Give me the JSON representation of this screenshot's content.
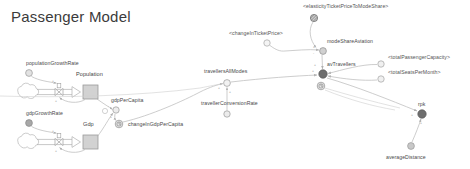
{
  "diagram": {
    "title": "Passenger Model",
    "type": "system-dynamics-stock-and-flow",
    "background_color": "#ffffff",
    "label_color": "#4a4a4a",
    "link_color": "#b8b8b8",
    "node_fill": "#d9d9d9",
    "node_stroke": "#9a9a9a",
    "highlight_fill": "#6e6e6e"
  },
  "stocks": [
    {
      "id": "population",
      "label": "Population",
      "x": 83,
      "y": 85,
      "w": 15,
      "h": 14,
      "label_x": 76,
      "label_y": 76
    },
    {
      "id": "gdp",
      "label": "Gdp",
      "x": 83,
      "y": 135,
      "w": 15,
      "h": 14,
      "label_x": 83,
      "label_y": 126
    }
  ],
  "flows": [
    {
      "id": "population-inflow",
      "source_cloud_x": 26,
      "source_cloud_y": 92,
      "valve_x": 59,
      "valve_y": 92,
      "target_x": 83,
      "target_y": 92
    },
    {
      "id": "gdp-inflow",
      "source_cloud_x": 26,
      "source_cloud_y": 142,
      "valve_x": 59,
      "valve_y": 142,
      "target_x": 83,
      "target_y": 142
    }
  ],
  "variables": [
    {
      "id": "populationGrowthRate",
      "label": "populationGrowthRate",
      "x": 29,
      "y": 73,
      "r": 3.4,
      "style": "plain",
      "label_x": 26,
      "label_y": 64,
      "label_anchor": "start"
    },
    {
      "id": "gdpGrowthRate",
      "label": "gdpGrowthRate",
      "x": 29,
      "y": 123,
      "r": 3.4,
      "style": "filled",
      "label_x": 26,
      "label_y": 114,
      "label_anchor": "start"
    },
    {
      "id": "gdpPerCapita",
      "label": "gdpPerCapita",
      "x": 116,
      "y": 110,
      "r": 3.2,
      "style": "plain",
      "label_x": 112,
      "label_y": 101,
      "label_anchor": "start"
    },
    {
      "id": "changeInGdpPerCapita",
      "label": "changeInGdpPerCapita",
      "x": 119,
      "y": 124,
      "r": 3.8,
      "style": "clock",
      "label_x": 128,
      "label_y": 127,
      "label_anchor": "start"
    },
    {
      "id": "travellersAllModes",
      "label": "travellersAllModes",
      "x": 227,
      "y": 83,
      "r": 3.4,
      "style": "plain",
      "label_x": 227,
      "label_y": 72,
      "label_anchor": "middle"
    },
    {
      "id": "travellerConversionRate",
      "label": "travellerConversionRate",
      "x": 227,
      "y": 114,
      "r": 3.2,
      "style": "plain",
      "label_x": 227,
      "label_y": 105,
      "label_anchor": "middle"
    },
    {
      "id": "changeInTicketPrice",
      "label": "<changeInTicketPrice>",
      "x": 267,
      "y": 43,
      "r": 3.2,
      "style": "plain",
      "label_x": 267,
      "label_y": 35,
      "label_anchor": "middle",
      "shadow": true
    },
    {
      "id": "elasticityTicketPriceToModeShare",
      "label": "<elasticityTicketPriceToModeShare>",
      "x": 314,
      "y": 18,
      "r": 3.6,
      "style": "hatched",
      "label_x": 314,
      "label_y": 10,
      "label_anchor": "start",
      "shadow": true
    },
    {
      "id": "modeShareAviation",
      "label": "modeShareAviation",
      "x": 323,
      "y": 51,
      "r": 3.4,
      "style": "plain",
      "label_x": 327,
      "label_y": 43,
      "label_anchor": "start"
    },
    {
      "id": "avTravellers",
      "label": "avTravellers",
      "x": 323,
      "y": 74,
      "r": 4.2,
      "style": "filled",
      "label_x": 327,
      "label_y": 65,
      "label_anchor": "start"
    },
    {
      "id": "avTravellersValve",
      "label": "",
      "x": 321,
      "y": 86,
      "r": 3.8,
      "style": "clock",
      "label_x": 0,
      "label_y": 0,
      "label_anchor": "start"
    },
    {
      "id": "totalPassengerCapacity",
      "label": "<totalPassengerCapacity>",
      "x": 381,
      "y": 64,
      "r": 3.2,
      "style": "plain",
      "label_x": 389,
      "label_y": 58,
      "label_anchor": "start",
      "shadow": true
    },
    {
      "id": "totalSeatsPerMonth",
      "label": "<totalSeatsPerMonth>",
      "x": 381,
      "y": 79,
      "r": 3.2,
      "style": "plain",
      "label_x": 389,
      "label_y": 73,
      "label_anchor": "start",
      "shadow": true
    },
    {
      "id": "rpk",
      "label": "rpk",
      "x": 422,
      "y": 114,
      "r": 4.2,
      "style": "filled",
      "label_x": 422,
      "label_y": 105,
      "label_anchor": "middle"
    },
    {
      "id": "averageDistance",
      "label": "averageDistance",
      "x": 411,
      "y": 146,
      "r": 3.4,
      "style": "plain",
      "label_x": 411,
      "label_y": 158,
      "label_anchor": "middle"
    }
  ],
  "links": [
    {
      "id": "populationGrowthRate-to-valve",
      "from": "populationGrowthRate",
      "to": "population-inflow",
      "polarity": "+"
    },
    {
      "id": "population-to-valve",
      "from": "population",
      "to": "population-inflow",
      "polarity": "+"
    },
    {
      "id": "gdpGrowthRate-to-valve",
      "from": "gdpGrowthRate",
      "to": "gdp-inflow",
      "polarity": "+"
    },
    {
      "id": "gdp-to-valve",
      "from": "gdp",
      "to": "gdp-inflow",
      "polarity": "+"
    },
    {
      "id": "population-to-gdpPerCapita",
      "from": "population",
      "to": "gdpPerCapita",
      "polarity": "-"
    },
    {
      "id": "gdp-to-gdpPerCapita",
      "from": "gdp",
      "to": "gdpPerCapita",
      "polarity": "+"
    },
    {
      "id": "gdpPerCapita-to-changeInGdpPerCapita",
      "from": "gdpPerCapita",
      "to": "changeInGdpPerCapita",
      "polarity": "+"
    },
    {
      "id": "changeInGdpPerCapita-to-travellersAllModes",
      "from": "changeInGdpPerCapita",
      "to": "travellersAllModes",
      "polarity": "+"
    },
    {
      "id": "travellerConversionRate-to-travellersAllModes",
      "from": "travellerConversionRate",
      "to": "travellersAllModes",
      "polarity": "+"
    },
    {
      "id": "travellersAllModes-to-avTravellers",
      "from": "travellersAllModes",
      "to": "avTravellers",
      "polarity": "+"
    },
    {
      "id": "changeInTicketPrice-to-modeShareAviation",
      "from": "changeInTicketPrice",
      "to": "modeShareAviation",
      "polarity": "+"
    },
    {
      "id": "elasticity-to-modeShareAviation",
      "from": "elasticityTicketPriceToModeShare",
      "to": "modeShareAviation",
      "polarity": "+"
    },
    {
      "id": "modeShareAviation-to-avTravellers",
      "from": "modeShareAviation",
      "to": "avTravellers",
      "polarity": "+"
    },
    {
      "id": "totalPassengerCapacity-to-avTravellers",
      "from": "totalPassengerCapacity",
      "to": "avTravellers",
      "polarity": "+"
    },
    {
      "id": "totalSeatsPerMonth-to-avTravellers",
      "from": "totalSeatsPerMonth",
      "to": "avTravellers",
      "polarity": "+"
    },
    {
      "id": "avTravellers-to-rpk",
      "from": "avTravellers",
      "to": "rpk",
      "polarity": "+"
    },
    {
      "id": "averageDistance-to-rpk",
      "from": "averageDistance",
      "to": "rpk",
      "polarity": "+"
    }
  ]
}
